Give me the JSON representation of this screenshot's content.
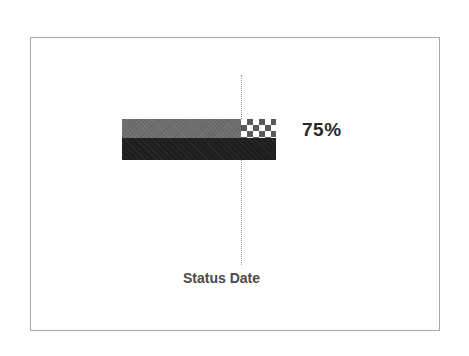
{
  "diagram": {
    "type": "progress-bar-with-status-line",
    "progress": {
      "percent_label": "75%",
      "percent_value": 75
    },
    "status_line": {
      "label": "Status Date"
    },
    "colors": {
      "frame_border": "#a8a8a8",
      "bar_top_fill": "#6e6e6e",
      "bar_bottom_fill": "#1e1e1e",
      "checker_fill": "#5a5a5a",
      "status_line": "#9a9a9a",
      "percent_text": "#2a2a2a",
      "status_text": "#4a4a4a"
    }
  }
}
